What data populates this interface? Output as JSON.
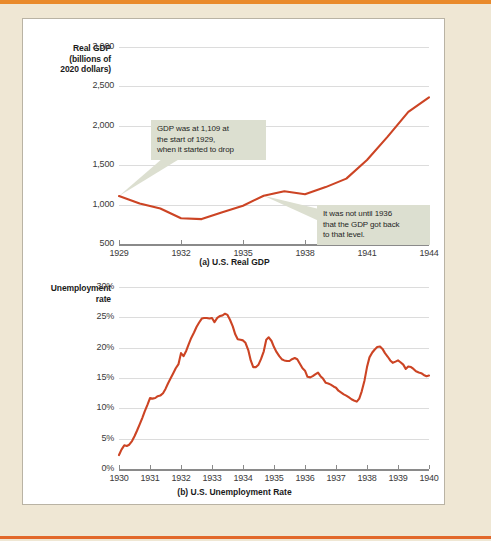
{
  "figure": {
    "page_background": "#efe7d4",
    "accent_rule_color": "#e98a2b",
    "line_color": "#cc4424",
    "callout_background": "#dcdfd0"
  },
  "chart_data": [
    {
      "type": "line",
      "id": "us-real-gdp",
      "title": "",
      "caption": "(a) U.S. Real GDP",
      "ylabel": "Real GDP (billions of 2020 dollars)",
      "ylabel_lines": [
        "Real GDP",
        "(billions of",
        "2020 dollars)"
      ],
      "xlabel": "",
      "xlim": [
        1929,
        1944
      ],
      "ylim": [
        500,
        3000
      ],
      "ytick_labels": [
        "500",
        "1,000",
        "1,500",
        "2,000",
        "2,500",
        "3,000"
      ],
      "ytick_values": [
        500,
        1000,
        1500,
        2000,
        2500,
        3000
      ],
      "xtick_labels": [
        "1929",
        "1932",
        "1935",
        "1938",
        "1941",
        "1944"
      ],
      "xtick_values": [
        1929,
        1932,
        1935,
        1938,
        1941,
        1944
      ],
      "grid": true,
      "legend": "none",
      "series": [
        {
          "name": "Real GDP",
          "color": "#cc4424",
          "x": [
            1929,
            1930,
            1931,
            1932,
            1933,
            1934,
            1935,
            1936,
            1937,
            1938,
            1939,
            1940,
            1941,
            1942,
            1943,
            1944
          ],
          "values": [
            1109,
            1015,
            950,
            827,
            816,
            904,
            985,
            1113,
            1170,
            1131,
            1222,
            1330,
            1566,
            1862,
            2177,
            2362
          ]
        }
      ],
      "annotations": [
        {
          "id": "gdp-start-note",
          "text": "GDP was at 1,109 at the start of 1929, when it started to drop",
          "lines": [
            "GDP was at 1,109 at",
            "the start of 1929,",
            "when it started to drop"
          ],
          "points_to_year": 1929,
          "points_to_value": 1109
        },
        {
          "id": "gdp-recovery-note",
          "text": "It was not until 1936 that the GDP got back to that level.",
          "lines": [
            "It was not until 1936",
            "that the GDP got back",
            "to that level."
          ],
          "points_to_year": 1936,
          "points_to_value": 1113
        }
      ]
    },
    {
      "type": "line",
      "id": "us-unemployment-rate",
      "title": "",
      "caption": "(b) U.S. Unemployment Rate",
      "ylabel": "Unemployment rate",
      "ylabel_lines": [
        "Unemployment",
        "rate"
      ],
      "xlabel": "",
      "xlim": [
        1930,
        1940
      ],
      "ylim": [
        0,
        30
      ],
      "ytick_labels": [
        "0%",
        "5%",
        "10%",
        "15%",
        "20%",
        "25%",
        "30%"
      ],
      "ytick_values": [
        0,
        5,
        10,
        15,
        20,
        25,
        30
      ],
      "xtick_labels": [
        "1930",
        "1931",
        "1932",
        "1933",
        "1934",
        "1935",
        "1936",
        "1937",
        "1938",
        "1939",
        "1940"
      ],
      "xtick_values": [
        1930,
        1931,
        1932,
        1933,
        1934,
        1935,
        1936,
        1937,
        1938,
        1939,
        1940
      ],
      "grid": true,
      "legend": "none",
      "series": [
        {
          "name": "Unemployment rate",
          "color": "#cc4424",
          "x": [
            1930.0,
            1930.08,
            1930.17,
            1930.25,
            1930.33,
            1930.42,
            1930.5,
            1930.58,
            1930.67,
            1930.75,
            1930.83,
            1930.92,
            1931.0,
            1931.08,
            1931.17,
            1931.25,
            1931.33,
            1931.42,
            1931.5,
            1931.58,
            1931.67,
            1931.75,
            1931.83,
            1931.92,
            1932.0,
            1932.08,
            1932.17,
            1932.25,
            1932.33,
            1932.42,
            1932.5,
            1932.58,
            1932.67,
            1932.75,
            1932.83,
            1932.92,
            1933.0,
            1933.08,
            1933.17,
            1933.25,
            1933.33,
            1933.42,
            1933.5,
            1933.58,
            1933.67,
            1933.75,
            1933.83,
            1933.92,
            1934.0,
            1934.08,
            1934.17,
            1934.25,
            1934.33,
            1934.42,
            1934.5,
            1934.58,
            1934.67,
            1934.75,
            1934.83,
            1934.92,
            1935.0,
            1935.08,
            1935.17,
            1935.25,
            1935.33,
            1935.42,
            1935.5,
            1935.58,
            1935.67,
            1935.75,
            1935.83,
            1935.92,
            1936.0,
            1936.08,
            1936.17,
            1936.25,
            1936.33,
            1936.42,
            1936.5,
            1936.58,
            1936.67,
            1936.75,
            1936.83,
            1936.92,
            1937.0,
            1937.08,
            1937.17,
            1937.25,
            1937.33,
            1937.42,
            1937.5,
            1937.58,
            1937.67,
            1937.75,
            1937.83,
            1937.92,
            1938.0,
            1938.08,
            1938.17,
            1938.25,
            1938.33,
            1938.42,
            1938.5,
            1938.58,
            1938.67,
            1938.75,
            1938.83,
            1938.92,
            1939.0,
            1939.08,
            1939.17,
            1939.25,
            1939.33,
            1939.42,
            1939.5,
            1939.58,
            1939.67,
            1939.75,
            1939.83,
            1939.92,
            1940.0
          ],
          "values": [
            2.3,
            3.2,
            3.9,
            3.8,
            4.0,
            4.6,
            5.4,
            6.3,
            7.4,
            8.4,
            9.5,
            10.6,
            11.7,
            11.6,
            11.7,
            12.0,
            12.1,
            12.5,
            13.2,
            14.1,
            15.0,
            15.8,
            16.6,
            17.3,
            19.1,
            18.6,
            19.5,
            20.6,
            21.6,
            22.5,
            23.4,
            24.1,
            24.8,
            24.9,
            24.9,
            24.8,
            24.9,
            24.2,
            24.9,
            25.2,
            25.3,
            25.6,
            25.4,
            24.6,
            23.5,
            22.2,
            21.4,
            21.3,
            21.2,
            20.8,
            19.6,
            17.9,
            16.8,
            16.8,
            17.2,
            18.1,
            19.4,
            21.3,
            21.7,
            21.1,
            20.1,
            19.3,
            18.6,
            18.1,
            17.9,
            17.8,
            17.8,
            18.1,
            18.3,
            18.1,
            17.4,
            16.6,
            16.2,
            15.2,
            15.1,
            15.3,
            15.6,
            15.9,
            15.3,
            14.9,
            14.2,
            14.1,
            13.9,
            13.6,
            13.4,
            12.9,
            12.6,
            12.3,
            12.1,
            11.8,
            11.5,
            11.3,
            11.1,
            11.6,
            12.8,
            14.6,
            16.8,
            18.4,
            19.2,
            19.7,
            20.1,
            20.2,
            19.8,
            19.1,
            18.5,
            17.9,
            17.5,
            17.7,
            17.9,
            17.6,
            17.2,
            16.5,
            16.9,
            16.8,
            16.5,
            16.1,
            15.9,
            15.8,
            15.5,
            15.3,
            15.4
          ]
        }
      ],
      "annotations": []
    }
  ]
}
